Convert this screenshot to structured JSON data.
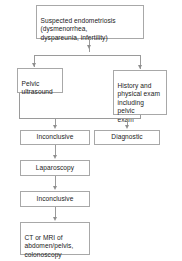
{
  "diagram": {
    "type": "flowchart",
    "colors": {
      "box_border": "#a8a8a8",
      "box_fill": "#ffffff",
      "connector": "#9a9a9a",
      "text": "#1b1b1b"
    },
    "nodes": [
      {
        "id": "suspected",
        "text": "Suspected endometriosis\n(dysmenorrhea,\ndyspareunia, infertility)"
      },
      {
        "id": "pelvic-ultrasound",
        "text": "Pelvic\nultrasound"
      },
      {
        "id": "history-physical",
        "text": "History and\nphysical exam\nincluding pelvic\nexam"
      },
      {
        "id": "inconclusive-1",
        "text": "Inconclusive"
      },
      {
        "id": "diagnostic",
        "text": "Diagnostic"
      },
      {
        "id": "laparoscopy",
        "text": "Laparoscopy"
      },
      {
        "id": "inconclusive-2",
        "text": "Inconclusive"
      },
      {
        "id": "ct-mri",
        "text": "CT or MRI of\nabdomen/pelvis,\ncolonoscopy"
      }
    ],
    "edges": [
      {
        "from": "suspected",
        "to": "pelvic-ultrasound"
      },
      {
        "from": "suspected",
        "to": "history-physical"
      },
      {
        "from": "pelvic-ultrasound",
        "to": "inconclusive-1"
      },
      {
        "from": "history-physical",
        "to": "inconclusive-1"
      },
      {
        "from": "history-physical",
        "to": "diagnostic"
      },
      {
        "from": "inconclusive-1",
        "to": "laparoscopy"
      },
      {
        "from": "laparoscopy",
        "to": "inconclusive-2"
      },
      {
        "from": "inconclusive-2",
        "to": "ct-mri"
      }
    ]
  }
}
